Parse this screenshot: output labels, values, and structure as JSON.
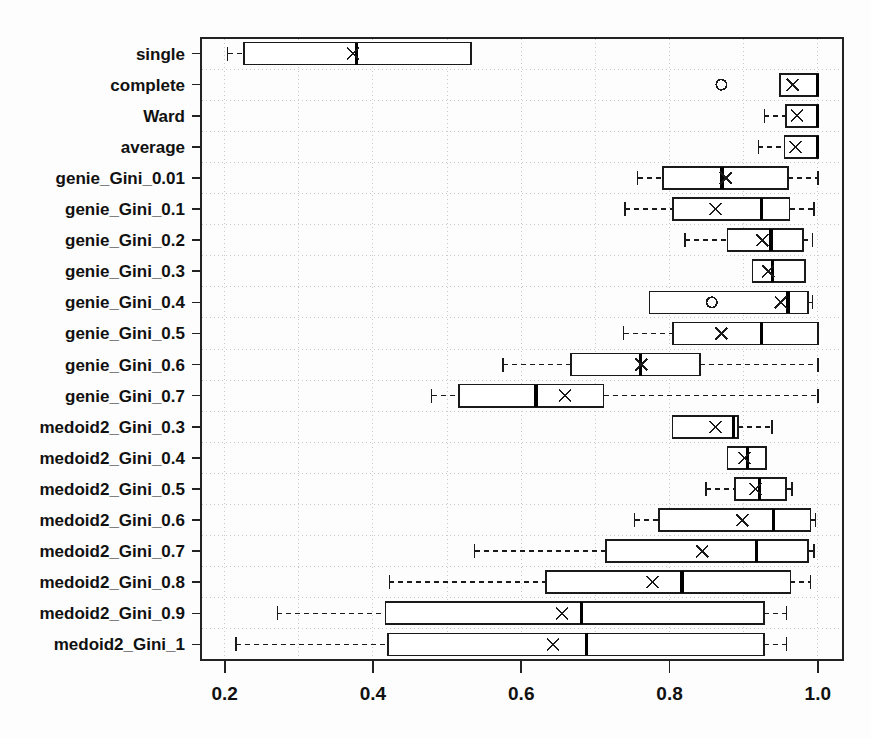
{
  "figure": {
    "background": "#fdfdfd",
    "frame_color": "#222222",
    "box_color": "#1a1a1a",
    "grid_color": "#c8c8c8",
    "median_color": "#000000",
    "mean_marker": "x",
    "outlier_marker": "o"
  },
  "axis": {
    "x_ticks": [
      "0.2",
      "0.4",
      "0.6",
      "0.8",
      "1.0"
    ],
    "x_tick_values": [
      0.2,
      0.4,
      0.6,
      0.8,
      1.0
    ],
    "x_min": 0.168,
    "x_max": 1.034,
    "xlabel": "",
    "ylabel": "",
    "title": ""
  },
  "chart_data": {
    "type": "boxplot",
    "title": "",
    "xlabel": "",
    "ylabel": "",
    "xlim": [
      0.168,
      1.034
    ],
    "grid": true,
    "orientation": "horizontal",
    "categories": [
      "single",
      "complete",
      "Ward",
      "average",
      "genie_Gini_0.01",
      "genie_Gini_0.1",
      "genie_Gini_0.2",
      "genie_Gini_0.3",
      "genie_Gini_0.4",
      "genie_Gini_0.5",
      "genie_Gini_0.6",
      "genie_Gini_0.7",
      "medoid2_Gini_0.3",
      "medoid2_Gini_0.4",
      "medoid2_Gini_0.5",
      "medoid2_Gini_0.6",
      "medoid2_Gini_0.7",
      "medoid2_Gini_0.8",
      "medoid2_Gini_0.9",
      "medoid2_Gini_1"
    ],
    "boxes": [
      {
        "label": "single",
        "whisker_low": 0.204,
        "q1": 0.226,
        "median": 0.378,
        "mean": 0.373,
        "q3": 0.532,
        "whisker_high": 0.532,
        "outliers": []
      },
      {
        "label": "complete",
        "whisker_low": 0.949,
        "q1": 0.949,
        "median": 1.0,
        "mean": 0.966,
        "q3": 1.0,
        "whisker_high": 1.0,
        "outliers": [
          0.87
        ]
      },
      {
        "label": "Ward",
        "whisker_low": 0.928,
        "q1": 0.957,
        "median": 1.0,
        "mean": 0.972,
        "q3": 1.0,
        "whisker_high": 1.0,
        "outliers": []
      },
      {
        "label": "average",
        "whisker_low": 0.92,
        "q1": 0.955,
        "median": 1.0,
        "mean": 0.97,
        "q3": 1.0,
        "whisker_high": 1.0,
        "outliers": []
      },
      {
        "label": "genie_Gini_0.01",
        "whisker_low": 0.757,
        "q1": 0.791,
        "median": 0.871,
        "mean": 0.876,
        "q3": 0.96,
        "whisker_high": 1.0,
        "outliers": []
      },
      {
        "label": "genie_Gini_0.1",
        "whisker_low": 0.74,
        "q1": 0.805,
        "median": 0.924,
        "mean": 0.862,
        "q3": 0.962,
        "whisker_high": 0.995,
        "outliers": []
      },
      {
        "label": "genie_Gini_0.2",
        "whisker_low": 0.821,
        "q1": 0.878,
        "median": 0.937,
        "mean": 0.925,
        "q3": 0.98,
        "whisker_high": 0.993,
        "outliers": []
      },
      {
        "label": "genie_Gini_0.3",
        "whisker_low": 0.912,
        "q1": 0.912,
        "median": 0.939,
        "mean": 0.933,
        "q3": 0.983,
        "whisker_high": 0.983,
        "outliers": []
      },
      {
        "label": "genie_Gini_0.4",
        "whisker_low": 0.773,
        "q1": 0.773,
        "median": 0.96,
        "mean": 0.95,
        "q3": 0.987,
        "whisker_high": 0.993,
        "outliers": [
          0.857
        ]
      },
      {
        "label": "genie_Gini_0.5",
        "whisker_low": 0.738,
        "q1": 0.805,
        "median": 0.924,
        "mean": 0.87,
        "q3": 1.0,
        "whisker_high": 1.0,
        "outliers": []
      },
      {
        "label": "genie_Gini_0.6",
        "whisker_low": 0.575,
        "q1": 0.667,
        "median": 0.761,
        "mean": 0.762,
        "q3": 0.841,
        "whisker_high": 1.0,
        "outliers": []
      },
      {
        "label": "genie_Gini_0.7",
        "whisker_low": 0.479,
        "q1": 0.516,
        "median": 0.62,
        "mean": 0.659,
        "q3": 0.711,
        "whisker_high": 1.0,
        "outliers": []
      },
      {
        "label": "medoid2_Gini_0.3",
        "whisker_low": 0.804,
        "q1": 0.804,
        "median": 0.886,
        "mean": 0.862,
        "q3": 0.892,
        "whisker_high": 0.938,
        "outliers": []
      },
      {
        "label": "medoid2_Gini_0.4",
        "whisker_low": 0.878,
        "q1": 0.878,
        "median": 0.905,
        "mean": 0.901,
        "q3": 0.93,
        "whisker_high": 0.93,
        "outliers": []
      },
      {
        "label": "medoid2_Gini_0.5",
        "whisker_low": 0.849,
        "q1": 0.888,
        "median": 0.921,
        "mean": 0.916,
        "q3": 0.957,
        "whisker_high": 0.965,
        "outliers": []
      },
      {
        "label": "medoid2_Gini_0.6",
        "whisker_low": 0.753,
        "q1": 0.786,
        "median": 0.94,
        "mean": 0.898,
        "q3": 0.99,
        "whisker_high": 0.997,
        "outliers": []
      },
      {
        "label": "medoid2_Gini_0.7",
        "whisker_low": 0.537,
        "q1": 0.714,
        "median": 0.917,
        "mean": 0.844,
        "q3": 0.987,
        "whisker_high": 0.995,
        "outliers": []
      },
      {
        "label": "medoid2_Gini_0.8",
        "whisker_low": 0.422,
        "q1": 0.633,
        "median": 0.817,
        "mean": 0.777,
        "q3": 0.963,
        "whisker_high": 0.99,
        "outliers": []
      },
      {
        "label": "medoid2_Gini_0.9",
        "whisker_low": 0.271,
        "q1": 0.417,
        "median": 0.681,
        "mean": 0.655,
        "q3": 0.927,
        "whisker_high": 0.958,
        "outliers": []
      },
      {
        "label": "medoid2_Gini_1",
        "whisker_low": 0.215,
        "q1": 0.42,
        "median": 0.688,
        "mean": 0.643,
        "q3": 0.927,
        "whisker_high": 0.958,
        "outliers": []
      }
    ]
  }
}
